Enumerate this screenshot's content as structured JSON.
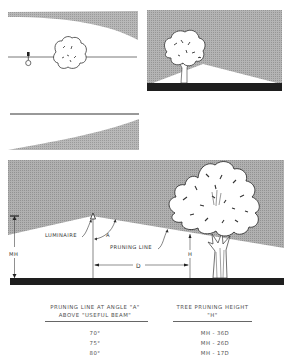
{
  "figure": {
    "panels": [
      {
        "id": "plan-view-top",
        "description": "Plan view: luminaire and tree crown along roadway with shaded light-distribution curve above"
      },
      {
        "id": "elevation-small",
        "description": "Elevation: tree silhouette against shaded background with lit triangular beam over dark ground"
      },
      {
        "id": "plan-view-bottom",
        "description": "Plan view: roadway line with shaded light-distribution curve below"
      },
      {
        "id": "main-elevation",
        "description": "Elevation showing luminaire, pruning line at angle A, mounting height MH, distance D, and tree pruning height H"
      }
    ],
    "labels": {
      "luminaire": "LUMINAIRE",
      "angle": "A",
      "pruning_line": "PRUNING LINE",
      "mounting_height": "MH",
      "distance": "D",
      "pruning_height": "H"
    },
    "colors": {
      "shade": "#a9a9a9",
      "ground": "#1e1e1e",
      "line": "#333333",
      "background": "#ffffff"
    }
  },
  "table": {
    "headers": [
      {
        "line1": "PRUNING LINE AT ANGLE \"A\"",
        "line2": "ABOVE \"USEFUL BEAM\""
      },
      {
        "line1": "TREE PRUNING HEIGHT",
        "line2": "\"H\""
      }
    ],
    "rows": [
      {
        "angle": "70°",
        "height": "MH - 36D"
      },
      {
        "angle": "75°",
        "height": "MH - 26D"
      },
      {
        "angle": "80°",
        "height": "MH - 17D"
      }
    ]
  }
}
